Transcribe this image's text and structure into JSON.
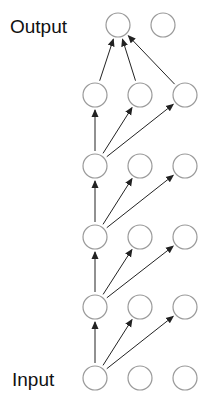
{
  "labels": {
    "output": "Output",
    "input": "Input"
  },
  "colors": {
    "node_stroke": "#9a9a9a",
    "edge": "#222222",
    "text": "#111111",
    "background": "#ffffff"
  },
  "node_radius": 12,
  "columns": [
    95,
    140,
    185
  ],
  "layers": [
    {
      "name": "input",
      "y": 378,
      "x": [
        95,
        140,
        185
      ]
    },
    {
      "name": "hidden-1",
      "y": 307,
      "x": [
        95,
        140,
        185
      ]
    },
    {
      "name": "hidden-2",
      "y": 237,
      "x": [
        95,
        140,
        185
      ]
    },
    {
      "name": "hidden-3",
      "y": 166,
      "x": [
        95,
        140,
        185
      ]
    },
    {
      "name": "hidden-4",
      "y": 95,
      "x": [
        95,
        140,
        185
      ]
    },
    {
      "name": "output",
      "y": 25,
      "x": [
        118,
        163
      ]
    }
  ],
  "edges": [
    {
      "from": [
        0,
        0
      ],
      "to": [
        1,
        0
      ]
    },
    {
      "from": [
        0,
        0
      ],
      "to": [
        1,
        1
      ]
    },
    {
      "from": [
        0,
        0
      ],
      "to": [
        1,
        2
      ]
    },
    {
      "from": [
        1,
        0
      ],
      "to": [
        2,
        0
      ]
    },
    {
      "from": [
        1,
        0
      ],
      "to": [
        2,
        1
      ]
    },
    {
      "from": [
        1,
        0
      ],
      "to": [
        2,
        2
      ]
    },
    {
      "from": [
        2,
        0
      ],
      "to": [
        3,
        0
      ]
    },
    {
      "from": [
        2,
        0
      ],
      "to": [
        3,
        1
      ]
    },
    {
      "from": [
        2,
        0
      ],
      "to": [
        3,
        2
      ]
    },
    {
      "from": [
        3,
        0
      ],
      "to": [
        4,
        0
      ]
    },
    {
      "from": [
        3,
        0
      ],
      "to": [
        4,
        1
      ]
    },
    {
      "from": [
        3,
        0
      ],
      "to": [
        4,
        2
      ]
    },
    {
      "from": [
        4,
        0
      ],
      "to": [
        5,
        0
      ]
    },
    {
      "from": [
        4,
        1
      ],
      "to": [
        5,
        0
      ]
    },
    {
      "from": [
        4,
        2
      ],
      "to": [
        5,
        0
      ]
    }
  ]
}
